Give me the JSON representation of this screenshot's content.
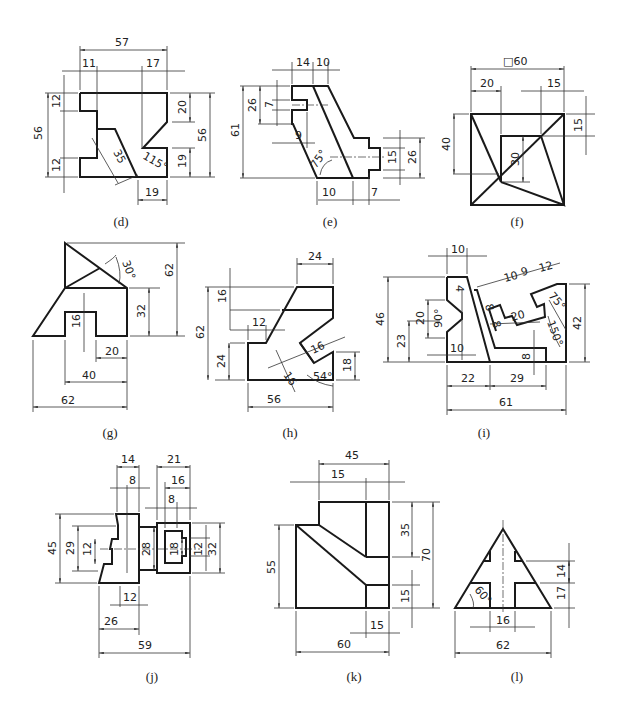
{
  "page": {
    "type": "engineering orthographic drawing exercises",
    "background": "#ffffff",
    "line_color": "#1a1a1a"
  },
  "figures": [
    {
      "id": "d",
      "caption": "(d)",
      "dimensions": {
        "top_overall": "57",
        "top_left": "11",
        "top_right": "17",
        "left_overall": "56",
        "left_top": "12",
        "left_bottom": "12",
        "right_overall": "56",
        "right_top": "20",
        "right_bottom": "19",
        "slot_width": "35",
        "angle": "115°",
        "bottom": "19"
      }
    },
    {
      "id": "e",
      "caption": "(e)",
      "dimensions": {
        "top_left": "14",
        "top_right": "10",
        "left_overall": "61",
        "left_inner": "26",
        "slot": "7",
        "slot_depth": "9",
        "angle": "75°",
        "right_inner": "15",
        "right_outer": "26",
        "bottom_left": "10",
        "bottom_right": "7"
      }
    },
    {
      "id": "f",
      "caption": "(f)",
      "dimensions": {
        "square": "□60",
        "top_left": "20",
        "top_right": "15",
        "left": "40",
        "inner": "30",
        "right": "15"
      }
    },
    {
      "id": "g",
      "caption": "(g)",
      "dimensions": {
        "angle": "30°",
        "right_overall": "62",
        "right_inner": "32",
        "slot_depth": "16",
        "slot_width": "20",
        "base": "40",
        "overall_width": "62"
      }
    },
    {
      "id": "h",
      "caption": "(h)",
      "dimensions": {
        "top": "24",
        "left_top": "16",
        "step": "12",
        "left_overall": "62",
        "left_bottom": "24",
        "slot_a": "16",
        "slot_b": "16",
        "angle": "54°",
        "right": "18",
        "bottom": "56"
      }
    },
    {
      "id": "i",
      "caption": "(i)",
      "dimensions": {
        "top": "10",
        "left_overall": "46",
        "v_notch_height": "20",
        "v_angle": "90°",
        "left_lower": "23",
        "notch_depth": "4",
        "notch_width": "10",
        "slot_a": "8",
        "slot_b": "8",
        "slot_len": "20",
        "oblique_a": "10",
        "oblique_b": "9",
        "oblique_c": "12",
        "angle_a": "75°",
        "angle_b": "150°",
        "right": "42",
        "step": "8",
        "bottom_left": "22",
        "bottom_mid": "29",
        "bottom_overall": "61"
      }
    },
    {
      "id": "j",
      "caption": "(j)",
      "dimensions": {
        "top_a": "14",
        "top_b": "8",
        "top_c": "21",
        "top_d": "16",
        "top_e": "8",
        "left_overall": "45",
        "left_inner": "29",
        "slot": "12",
        "mid": "28",
        "inner_slot": "18",
        "right_inner": "12",
        "right_overall": "32",
        "bottom_a": "12",
        "bottom_b": "26",
        "bottom_overall": "59"
      }
    },
    {
      "id": "k",
      "caption": "(k)",
      "dimensions": {
        "top_overall": "45",
        "top_inner": "15",
        "right_upper": "35",
        "right_overall": "70",
        "right_lower": "15",
        "left": "55",
        "bottom_inner": "15",
        "bottom_overall": "60"
      }
    },
    {
      "id": "l",
      "caption": "(l)",
      "dimensions": {
        "right_upper": "14",
        "right_lower": "17",
        "angle": "60°",
        "slot": "16",
        "base": "62"
      }
    }
  ]
}
